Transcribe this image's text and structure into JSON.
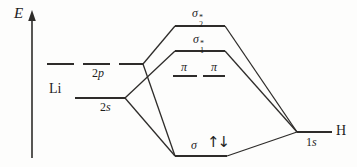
{
  "diagram_type": "molecular-orbital-energy-level-diagram",
  "axis": {
    "label": "E"
  },
  "atoms": {
    "left": {
      "symbol": "Li",
      "level_2p": {
        "num": "2",
        "letter": "p"
      },
      "level_2s": {
        "num": "2",
        "letter": "s"
      }
    },
    "right": {
      "symbol": "H",
      "level_1s": {
        "num": "1",
        "letter": "s"
      }
    }
  },
  "mo": {
    "sigma2": {
      "base": "σ",
      "sup": "*",
      "sub": "2"
    },
    "sigma1": {
      "base": "σ",
      "sup": "*",
      "sub": "1"
    },
    "pi1": "π",
    "pi2": "π",
    "sigma": "σ",
    "electrons": {
      "up": "↑",
      "down": "↓"
    }
  },
  "connections": [
    "2p–σ2*",
    "2p–σ",
    "2s–σ1*",
    "2s–σ",
    "σ2*–1s",
    "σ1*–1s",
    "σ–1s"
  ],
  "colors": {
    "line": "#2e2c2a",
    "text": "#1e1e1e",
    "background": "#fdfdfc"
  }
}
